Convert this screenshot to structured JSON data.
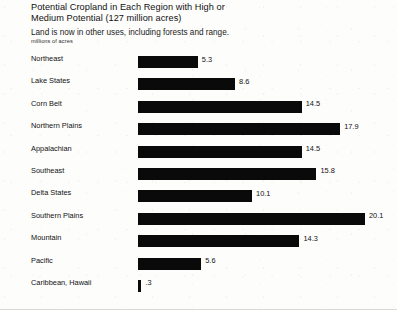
{
  "chart_data": {
    "type": "bar",
    "orientation": "horizontal",
    "title": "Potential Cropland in Each Region with High or\nMedium Potential (127 million acres)",
    "subtitle": "Land is now in other uses, including forests and range.",
    "xlabel": "millions of acres",
    "ylabel": "",
    "grid": false,
    "legend": null,
    "xlim": [
      0,
      20.1
    ],
    "bar_color": "#0a0a0a",
    "background_color": "#fdfdfc",
    "categories": [
      "Northeast",
      "Lake States",
      "Corn Belt",
      "Northern Plains",
      "Appalachian",
      "Southeast",
      "Delta States",
      "Southern Plains",
      "Mountain",
      "Pacific",
      "Caribbean, Hawaii"
    ],
    "values": [
      5.3,
      8.6,
      14.5,
      17.9,
      14.5,
      15.8,
      10.1,
      20.1,
      14.3,
      5.6,
      0.3
    ],
    "value_labels": [
      "5.3",
      "8.6",
      "14.5",
      "17.9",
      "14.5",
      "15.8",
      "10.1",
      "20.1",
      "14.3",
      "5.6",
      ".3"
    ],
    "rows": [
      {
        "label": "Northeast",
        "value": 5.3,
        "value_label": "5.3"
      },
      {
        "label": "Lake States",
        "value": 8.6,
        "value_label": "8.6"
      },
      {
        "label": "Corn Belt",
        "value": 14.5,
        "value_label": "14.5"
      },
      {
        "label": "Northern Plains",
        "value": 17.9,
        "value_label": "17.9"
      },
      {
        "label": "Appalachian",
        "value": 14.5,
        "value_label": "14.5"
      },
      {
        "label": "Southeast",
        "value": 15.8,
        "value_label": "15.8"
      },
      {
        "label": "Delta States",
        "value": 10.1,
        "value_label": "10.1"
      },
      {
        "label": "Southern Plains",
        "value": 20.1,
        "value_label": "20.1"
      },
      {
        "label": "Mountain",
        "value": 14.3,
        "value_label": "14.3"
      },
      {
        "label": "Pacific",
        "value": 5.6,
        "value_label": "5.6"
      },
      {
        "label": "Caribbean, Hawaii",
        "value": 0.3,
        "value_label": ".3"
      }
    ]
  }
}
